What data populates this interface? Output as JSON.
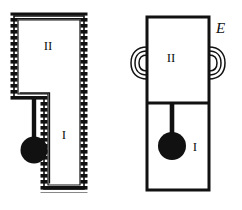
{
  "figure": {
    "background_color": "#ffffff",
    "line_color": "#111111",
    "fill_color": "#ffffff",
    "width": 242,
    "height": 210
  },
  "left_figure": {
    "name": "insulated-boot-shaped-vessel",
    "wall_style": "hatched-insulated",
    "chamber_upper_label": "II",
    "chamber_lower_label": "I",
    "has_pendulum": true,
    "pendulum_position": "outside-left",
    "outline": {
      "x": 14,
      "y": 16,
      "wide_width": 70,
      "step_y": 98,
      "narrow_left": 44,
      "bottom_y": 189
    },
    "labels": {
      "upper": {
        "text": "II",
        "x": 48,
        "y": 50
      },
      "lower": {
        "text": "I",
        "x": 64,
        "y": 139
      }
    }
  },
  "right_figure": {
    "name": "rigid-walled-vessel-with-coils",
    "wall_style": "solid-plain",
    "chamber_upper_label": "II",
    "chamber_lower_label": "I",
    "divider_label": "horizontal-partition",
    "has_pendulum": true,
    "pendulum_position": "inside-chamber-I",
    "coil_symbol_count": 2,
    "external_label": "E",
    "outline": {
      "x": 147,
      "y": 17,
      "width": 62,
      "divider_y": 103,
      "bottom_y": 190
    },
    "labels": {
      "upper": {
        "text": "II",
        "x": 171,
        "y": 62
      },
      "lower": {
        "text": "I",
        "x": 193,
        "y": 147
      },
      "external": {
        "text": "E",
        "x": 216,
        "y": 32
      }
    }
  }
}
